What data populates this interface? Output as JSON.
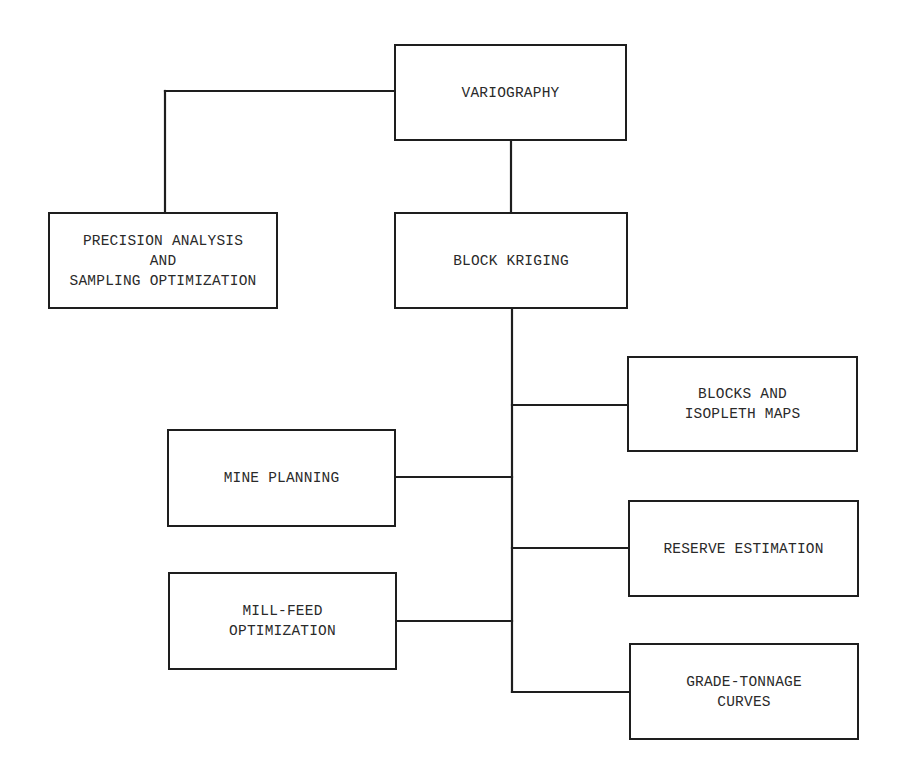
{
  "diagram": {
    "type": "flowchart",
    "colors": {
      "line": "#1e1e1e",
      "text": "#2a2a2a",
      "background": "#ffffff"
    },
    "nodes": {
      "variography": {
        "label": "VARIOGRAPHY"
      },
      "precision": {
        "label": "PRECISION ANALYSIS\n AND\nSAMPLING OPTIMIZATION",
        "lines": [
          "PRECISION ANALYSIS",
          "AND",
          "SAMPLING OPTIMIZATION"
        ]
      },
      "block_kriging": {
        "label": "BLOCK KRIGING"
      },
      "blocks_isopleth": {
        "label": "BLOCKS AND\nISOPLETH MAPS",
        "lines": [
          "BLOCKS AND",
          "ISOPLETH MAPS"
        ]
      },
      "mine_planning": {
        "label": "MINE PLANNING"
      },
      "reserve_estimation": {
        "label": "RESERVE ESTIMATION"
      },
      "mill_feed": {
        "label": "MILL-FEED\nOPTIMIZATION",
        "lines": [
          "MILL-FEED",
          "OPTIMIZATION"
        ]
      },
      "grade_tonnage": {
        "label": "GRADE-TONNAGE\nCURVES",
        "lines": [
          "GRADE-TONNAGE",
          "CURVES"
        ]
      }
    },
    "edges": [
      {
        "from": "VARIOGRAPHY",
        "to": "PRECISION ANALYSIS AND SAMPLING OPTIMIZATION"
      },
      {
        "from": "VARIOGRAPHY",
        "to": "BLOCK KRIGING"
      },
      {
        "from": "BLOCK KRIGING",
        "to": "BLOCKS AND ISOPLETH MAPS"
      },
      {
        "from": "BLOCK KRIGING",
        "to": "MINE PLANNING"
      },
      {
        "from": "BLOCK KRIGING",
        "to": "RESERVE ESTIMATION"
      },
      {
        "from": "BLOCK KRIGING",
        "to": "MILL-FEED OPTIMIZATION"
      },
      {
        "from": "BLOCK KRIGING",
        "to": "GRADE-TONNAGE CURVES"
      }
    ]
  }
}
